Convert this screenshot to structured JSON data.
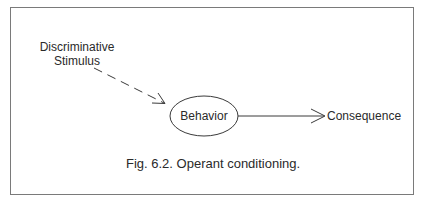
{
  "diagram": {
    "nodes": {
      "stimulus": {
        "line1": "Discriminative",
        "line2": "Stimulus"
      },
      "behavior": {
        "label": "Behavior"
      },
      "consequence": {
        "label": "Consequence"
      }
    },
    "edges": [
      {
        "from": "Discriminative Stimulus",
        "to": "Behavior",
        "style": "dashed"
      },
      {
        "from": "Behavior",
        "to": "Consequence",
        "style": "solid"
      }
    ],
    "caption": "Fig. 6.2. Operant conditioning."
  },
  "colors": {
    "line": "#3a3a3a",
    "frame": "#7a7a7a",
    "text": "#2a2a2a"
  }
}
